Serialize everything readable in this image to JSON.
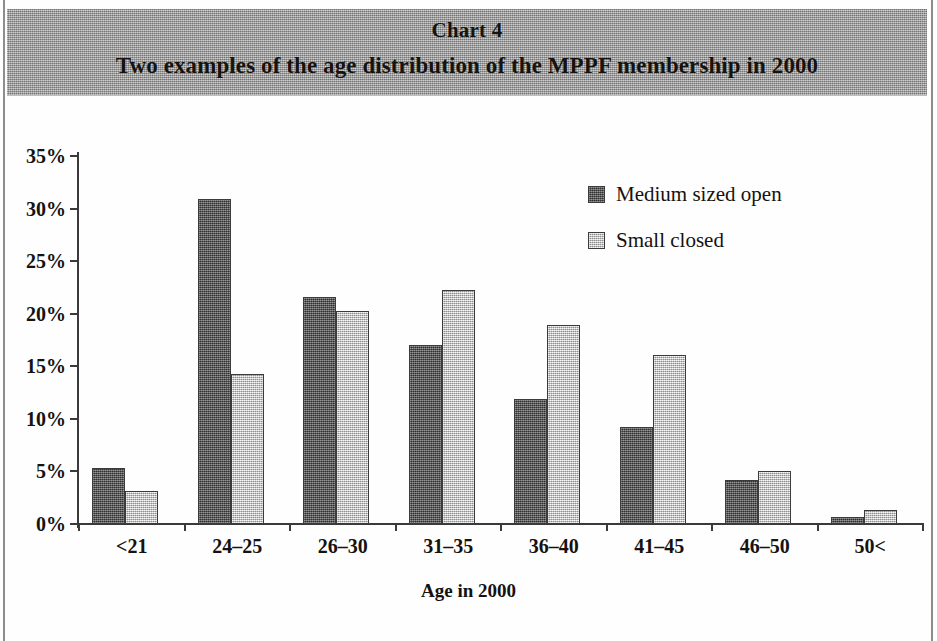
{
  "header": {
    "chart_number": "Chart 4",
    "caption": "Two examples of the age distribution of the MPPF membership in 2000"
  },
  "colors": {
    "band": "#9b9b9b",
    "series_dark": "#5f5f5f",
    "series_light": "#cfcfcf",
    "axis": "#3a3a3a",
    "text": "#16120f"
  },
  "chart_data": {
    "type": "bar",
    "title": "Two examples of the age distribution of the MPPF membership in 2000",
    "subtitle": "Chart 4",
    "xlabel": "Age in 2000",
    "ylabel": "",
    "categories": [
      "<21",
      "24–25",
      "26–30",
      "31–35",
      "36–40",
      "41–45",
      "46–50",
      "50<"
    ],
    "series": [
      {
        "name": "Medium sized open",
        "color": "#5f5f5f",
        "values": [
          5.3,
          30.9,
          21.6,
          17.0,
          11.9,
          9.2,
          4.2,
          0.7
        ]
      },
      {
        "name": "Small closed",
        "color": "#cfcfcf",
        "values": [
          3.1,
          14.3,
          20.3,
          22.3,
          18.9,
          16.1,
          5.0,
          1.3
        ]
      }
    ],
    "ylim": [
      0,
      35
    ],
    "yticks": [
      0,
      5,
      10,
      15,
      20,
      25,
      30,
      35
    ],
    "ytick_labels": [
      "0%",
      "5%",
      "10%",
      "15%",
      "20%",
      "25%",
      "30%",
      "35%"
    ],
    "grid": false,
    "legend_position": "upper right"
  }
}
